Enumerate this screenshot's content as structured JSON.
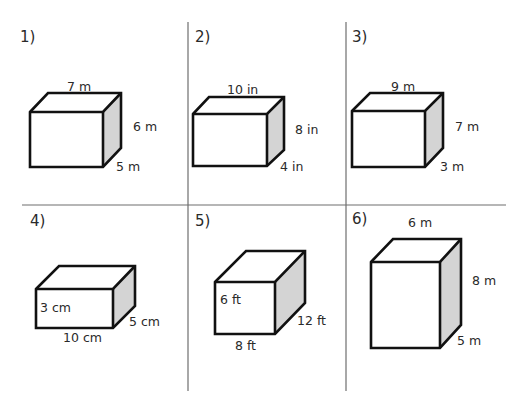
{
  "worksheet": {
    "layout": {
      "rows": 2,
      "columns": 3
    },
    "colors": {
      "grid_line": "#6e6e6e",
      "edge": "#111111",
      "side_face": "#d4d4d4",
      "text": "#2a2a2a"
    },
    "problems": [
      {
        "number": "1)",
        "shape": "rectangular-prism",
        "labels": {
          "length": "7 m",
          "height": "6 m",
          "depth": "5 m"
        }
      },
      {
        "number": "2)",
        "shape": "rectangular-prism",
        "labels": {
          "length": "10 in",
          "height": "8 in",
          "depth": "4 in"
        }
      },
      {
        "number": "3)",
        "shape": "rectangular-prism",
        "labels": {
          "length": "9 m",
          "height": "7 m",
          "depth": "3 m"
        }
      },
      {
        "number": "4)",
        "shape": "rectangular-prism",
        "labels": {
          "height": "3 cm",
          "length": "10 cm",
          "depth": "5 cm"
        }
      },
      {
        "number": "5)",
        "shape": "rectangular-prism",
        "labels": {
          "height": "6 ft",
          "length": "8 ft",
          "depth": "12 ft"
        }
      },
      {
        "number": "6)",
        "shape": "rectangular-prism",
        "labels": {
          "length": "6 m",
          "height": "8 m",
          "depth": "5 m"
        }
      }
    ]
  }
}
